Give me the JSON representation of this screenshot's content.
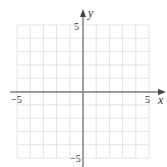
{
  "chart_data": {
    "type": "scatter",
    "title": "",
    "xlabel": "x",
    "ylabel": "y",
    "xlim": [
      -5,
      5
    ],
    "ylim": [
      -5,
      5
    ],
    "grid": true,
    "x_tick_labels": [
      "−5",
      "5"
    ],
    "y_tick_labels": [
      "5",
      "−5"
    ],
    "series": [],
    "colors": {
      "grid": "#dcdcdc",
      "x_axis": "#444444",
      "y_axis": "#8a8a8a",
      "text": "#333333"
    }
  }
}
